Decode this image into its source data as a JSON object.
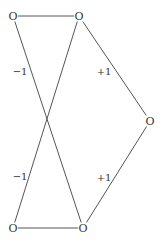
{
  "diagram": {
    "type": "graph",
    "nodes": [
      {
        "id": "n1",
        "label": "O",
        "x": 13,
        "y": 16
      },
      {
        "id": "n2",
        "label": "O",
        "x": 79,
        "y": 16
      },
      {
        "id": "n3",
        "label": "O",
        "x": 150,
        "y": 121
      },
      {
        "id": "n4",
        "label": "O",
        "x": 13,
        "y": 228
      },
      {
        "id": "n5",
        "label": "O",
        "x": 83,
        "y": 228
      }
    ],
    "edges": [
      {
        "from": "n1",
        "to": "n2",
        "label": ""
      },
      {
        "from": "n1",
        "to": "n5",
        "label": "−1"
      },
      {
        "from": "n2",
        "to": "n4",
        "label": "−1"
      },
      {
        "from": "n2",
        "to": "n3",
        "label": "+1"
      },
      {
        "from": "n3",
        "to": "n5",
        "label": "+1"
      },
      {
        "from": "n4",
        "to": "n5",
        "label": ""
      }
    ],
    "edge_labels": [
      {
        "text": "−1",
        "x": 20,
        "y": 72
      },
      {
        "text": "+1",
        "x": 104,
        "y": 72
      },
      {
        "text": "−1",
        "x": 20,
        "y": 177
      },
      {
        "text": "+1",
        "x": 104,
        "y": 178
      }
    ]
  }
}
